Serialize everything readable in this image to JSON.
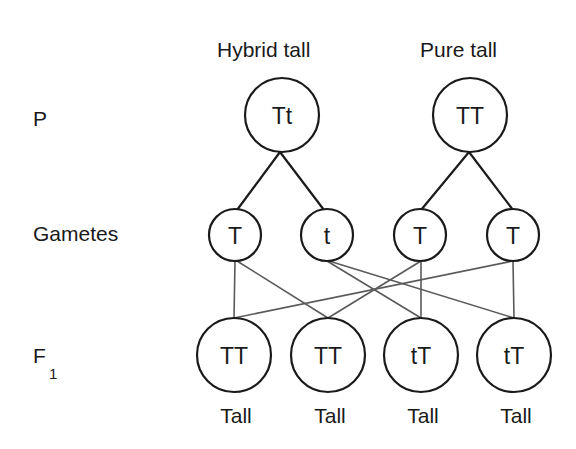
{
  "headers": {
    "hybrid": "Hybrid tall",
    "pure": "Pure tall"
  },
  "row_labels": {
    "parent": "P",
    "gametes": "Gametes",
    "f1": "F",
    "f1_sub": "1"
  },
  "parents": [
    {
      "genotype": "Tt",
      "label": "Hybrid tall"
    },
    {
      "genotype": "TT",
      "label": "Pure tall"
    }
  ],
  "gametes": [
    {
      "allele": "T",
      "parent": 0
    },
    {
      "allele": "t",
      "parent": 0
    },
    {
      "allele": "T",
      "parent": 1
    },
    {
      "allele": "T",
      "parent": 1
    }
  ],
  "offspring": [
    {
      "genotype": "TT",
      "phenotype": "Tall"
    },
    {
      "genotype": "TT",
      "phenotype": "Tall"
    },
    {
      "genotype": "tT",
      "phenotype": "Tall"
    },
    {
      "genotype": "tT",
      "phenotype": "Tall"
    }
  ],
  "crosses": [
    {
      "from_gamete": 0,
      "to_offspring": 0
    },
    {
      "from_gamete": 0,
      "to_offspring": 1
    },
    {
      "from_gamete": 1,
      "to_offspring": 2
    },
    {
      "from_gamete": 1,
      "to_offspring": 3
    },
    {
      "from_gamete": 2,
      "to_offspring": 1
    },
    {
      "from_gamete": 2,
      "to_offspring": 2
    },
    {
      "from_gamete": 3,
      "to_offspring": 0
    },
    {
      "from_gamete": 3,
      "to_offspring": 3
    }
  ],
  "colors": {
    "stroke": "#1a1a1a",
    "cross_line": "#5a5a5a",
    "background": "#ffffff"
  }
}
